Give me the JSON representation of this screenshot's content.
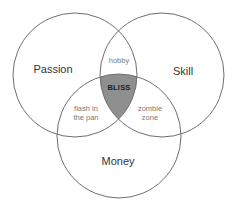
{
  "diagram": {
    "type": "venn",
    "colors": {
      "stroke": "#6e6e6e",
      "center_fill": "#8f8f8f",
      "background": "#ffffff"
    },
    "circles": [
      {
        "id": "passion",
        "label": "Passion",
        "cx": 75,
        "cy": 75,
        "r": 62
      },
      {
        "id": "skill",
        "label": "Skill",
        "cx": 162,
        "cy": 75,
        "r": 62
      },
      {
        "id": "money",
        "label": "Money",
        "cx": 119,
        "cy": 136,
        "r": 62
      }
    ],
    "intersections": {
      "passion_skill": "hobby",
      "passion_money_line1": "flash in",
      "passion_money_line2": "the pan",
      "skill_money_line1": "zombie",
      "skill_money_line2": "zone",
      "all_three": "BLISS"
    }
  }
}
